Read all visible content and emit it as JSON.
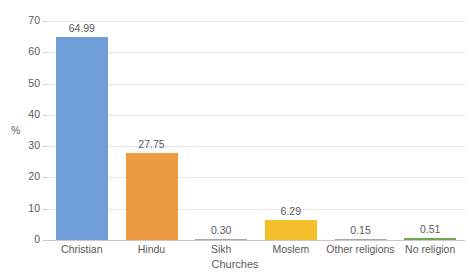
{
  "chart_data": {
    "type": "bar",
    "title": "",
    "xlabel": "Churches",
    "ylabel": "%",
    "categories": [
      "Christian",
      "Hindu",
      "Sikh",
      "Moslem",
      "Other religions",
      "No religion"
    ],
    "values": [
      64.99,
      27.75,
      0.3,
      6.29,
      0.15,
      0.51
    ],
    "value_labels": [
      "64.99",
      "27.75",
      "0.30",
      "6.29",
      "0.15",
      "0.51"
    ],
    "bar_colors": [
      "#6f9ed8",
      "#ed9b43",
      "#a6a6a6",
      "#f3c02b",
      "#a6a6a6",
      "#6fa84f"
    ],
    "ylim": [
      0,
      70
    ],
    "y_ticks": [
      0,
      10,
      20,
      30,
      40,
      50,
      60,
      70
    ],
    "y_tick_labels": [
      "0",
      "10",
      "20",
      "30",
      "40",
      "50",
      "60",
      "70"
    ],
    "grid": true,
    "grid_color": "#e8e8e8",
    "legend": false,
    "legend_position": "none",
    "axis_color": "#c9c9c9",
    "text_color": "#5a5a5a",
    "background": "#ffffff"
  }
}
